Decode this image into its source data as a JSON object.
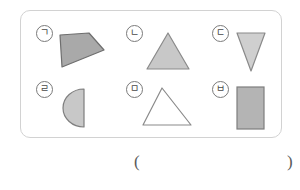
{
  "worksheet": {
    "panel_label": "shape-figure-panel",
    "border_color": "#d2d2d2",
    "background_color": "#ffffff"
  },
  "figures": [
    {
      "id": "giyeok",
      "label": "ㄱ",
      "shape_name": "quadrilateral",
      "fill": "#a9a9a9",
      "stroke": "#6e6e6e",
      "filled": true
    },
    {
      "id": "nieun",
      "label": "ㄴ",
      "shape_name": "triangle-up",
      "fill": "#c8c8c8",
      "stroke": "#8a8a8a",
      "filled": true
    },
    {
      "id": "digeut",
      "label": "ㄷ",
      "shape_name": "triangle-down",
      "fill": "#cfcfcf",
      "stroke": "#8a8a8a",
      "filled": true
    },
    {
      "id": "rieul",
      "label": "ㄹ",
      "shape_name": "semicircle",
      "fill": "#c8c8c8",
      "stroke": "#7e7e7e",
      "filled": true
    },
    {
      "id": "mieum",
      "label": "ㅁ",
      "shape_name": "triangle-outline",
      "fill": "#ffffff",
      "stroke": "#8a8a8a",
      "filled": false
    },
    {
      "id": "bieup",
      "label": "ㅂ",
      "shape_name": "rectangle",
      "fill": "#b4b4b4",
      "stroke": "#7e7e7e",
      "filled": true
    }
  ],
  "answer": {
    "open_paren": "(",
    "close_paren": ")",
    "value": ""
  }
}
